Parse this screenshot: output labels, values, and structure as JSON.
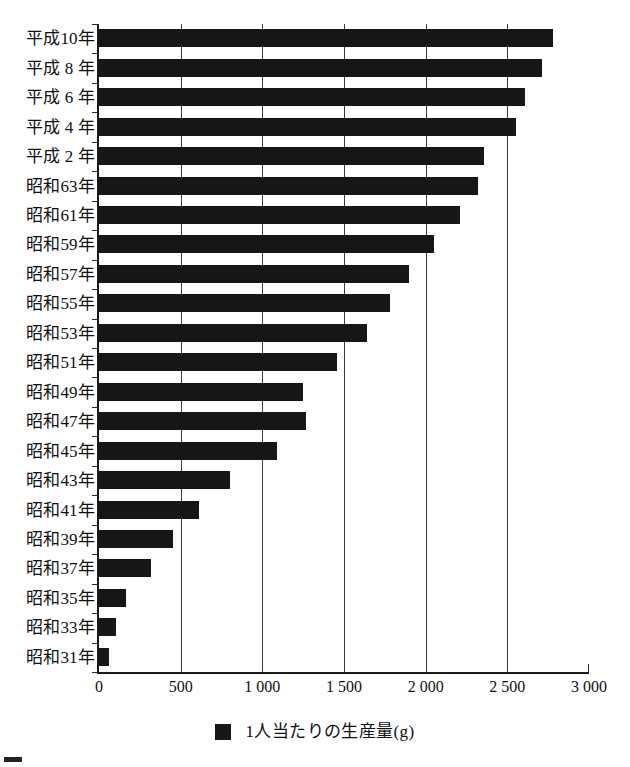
{
  "chart_data": {
    "type": "bar",
    "orientation": "horizontal",
    "title": "",
    "subtitle": "",
    "xlabel": "",
    "ylabel": "",
    "xlim": [
      0,
      3000
    ],
    "grid": true,
    "legend_position": "bottom-center",
    "legend": [
      "1人当たりの生産量(g)"
    ],
    "categories": [
      "平成10年",
      "平成 8 年",
      "平成 6 年",
      "平成 4 年",
      "平成 2 年",
      "昭和63年",
      "昭和61年",
      "昭和59年",
      "昭和57年",
      "昭和55年",
      "昭和53年",
      "昭和51年",
      "昭和49年",
      "昭和47年",
      "昭和45年",
      "昭和43年",
      "昭和41年",
      "昭和39年",
      "昭和37年",
      "昭和35年",
      "昭和33年",
      "昭和31年"
    ],
    "values": [
      2780,
      2710,
      2610,
      2550,
      2360,
      2320,
      2210,
      2050,
      1900,
      1780,
      1640,
      1460,
      1250,
      1270,
      1090,
      800,
      610,
      455,
      320,
      165,
      105,
      60
    ],
    "x_ticks": [
      0,
      500,
      1000,
      1500,
      2000,
      2500,
      3000
    ],
    "x_tick_labels": [
      "0",
      "500",
      "1 000",
      "1 500",
      "2 000",
      "2 500",
      "3 000"
    ],
    "series_color": "#171717"
  },
  "legend": {
    "marker_name": "filled-square-marker",
    "label": "1人当たりの生産量(g)"
  }
}
